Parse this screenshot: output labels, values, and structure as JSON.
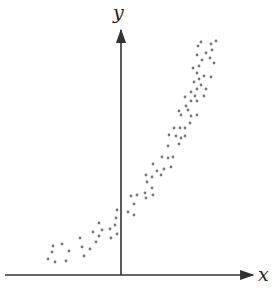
{
  "chart_data": {
    "type": "scatter",
    "title": "",
    "xlabel": "x",
    "ylabel": "y",
    "grid": false,
    "legend": null,
    "ticks": {
      "x": [],
      "y": []
    },
    "trend": "increasing, concave up (exponential-like)",
    "colors": {
      "axis": "#333333",
      "point": "#777777",
      "background": "#ffffff"
    },
    "pixel_frame": {
      "origin_px": [
        121,
        275
      ],
      "x_axis_px": [
        5,
        255
      ],
      "y_axis_px": [
        275,
        28
      ]
    },
    "points_px": [
      [
        48,
        259
      ],
      [
        55,
        262
      ],
      [
        66,
        261
      ],
      [
        52,
        252
      ],
      [
        53,
        246
      ],
      [
        62,
        244
      ],
      [
        69,
        251
      ],
      [
        80,
        238
      ],
      [
        82,
        247
      ],
      [
        84,
        256
      ],
      [
        90,
        249
      ],
      [
        96,
        242
      ],
      [
        93,
        232
      ],
      [
        99,
        223
      ],
      [
        99,
        236
      ],
      [
        102,
        230
      ],
      [
        110,
        229
      ],
      [
        111,
        238
      ],
      [
        115,
        225
      ],
      [
        116,
        218
      ],
      [
        117,
        210
      ],
      [
        117,
        234
      ],
      [
        128,
        212
      ],
      [
        131,
        196
      ],
      [
        134,
        204
      ],
      [
        134,
        215
      ],
      [
        137,
        195
      ],
      [
        145,
        193
      ],
      [
        146,
        175
      ],
      [
        146,
        198
      ],
      [
        147,
        182
      ],
      [
        152,
        177
      ],
      [
        152,
        188
      ],
      [
        153,
        164
      ],
      [
        153,
        195
      ],
      [
        157,
        171
      ],
      [
        161,
        175
      ],
      [
        162,
        157
      ],
      [
        164,
        169
      ],
      [
        168,
        158
      ],
      [
        171,
        167
      ],
      [
        173,
        157
      ],
      [
        168,
        146
      ],
      [
        169,
        135
      ],
      [
        174,
        128
      ],
      [
        176,
        136
      ],
      [
        179,
        144
      ],
      [
        179,
        111
      ],
      [
        180,
        128
      ],
      [
        181,
        115
      ],
      [
        181,
        138
      ],
      [
        185,
        97
      ],
      [
        185,
        128
      ],
      [
        185,
        136
      ],
      [
        186,
        106
      ],
      [
        188,
        110
      ],
      [
        190,
        123
      ],
      [
        191,
        92
      ],
      [
        191,
        101
      ],
      [
        191,
        116
      ],
      [
        193,
        68
      ],
      [
        194,
        82
      ],
      [
        195,
        96
      ],
      [
        197,
        55
      ],
      [
        197,
        73
      ],
      [
        197,
        89
      ],
      [
        197,
        101
      ],
      [
        197,
        115
      ],
      [
        198,
        46
      ],
      [
        199,
        66
      ],
      [
        199,
        79
      ],
      [
        201,
        42
      ],
      [
        201,
        85
      ],
      [
        202,
        60
      ],
      [
        204,
        76
      ],
      [
        204,
        96
      ],
      [
        206,
        53
      ],
      [
        206,
        89
      ],
      [
        210,
        58
      ],
      [
        211,
        44
      ],
      [
        211,
        77
      ],
      [
        212,
        50
      ],
      [
        214,
        63
      ],
      [
        216,
        41
      ]
    ]
  }
}
